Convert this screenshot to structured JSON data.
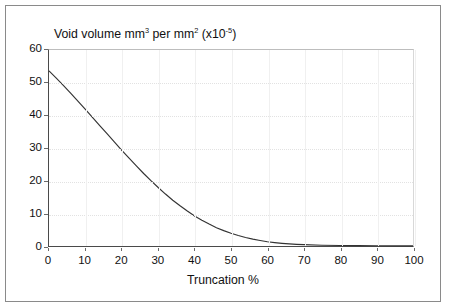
{
  "chart_data": {
    "type": "line",
    "title": "Void volume mm3 per mm2 (x10-5)",
    "title_parts": {
      "seg1": "Void volume mm",
      "sup1": "3",
      "seg2": " per mm",
      "sup2": "2",
      "seg3": " (x10",
      "sup3": "-5",
      "seg4": ")"
    },
    "xlabel": "Truncation %",
    "ylabel": "",
    "xlim": [
      0,
      100
    ],
    "ylim": [
      0,
      60
    ],
    "xticks": [
      "0",
      "10",
      "20",
      "30",
      "40",
      "50",
      "60",
      "70",
      "80",
      "90",
      "100"
    ],
    "yticks": [
      "0",
      "10",
      "20",
      "30",
      "40",
      "50",
      "60"
    ],
    "grid": "both-faint",
    "legend": "none",
    "line_color": "#333333",
    "x": [
      0,
      2,
      4,
      6,
      8,
      10,
      12,
      14,
      16,
      18,
      20,
      22,
      24,
      26,
      28,
      30,
      32,
      34,
      36,
      38,
      40,
      42,
      44,
      46,
      48,
      50,
      52,
      54,
      56,
      58,
      60,
      62,
      64,
      66,
      68,
      70,
      75,
      80,
      85,
      90,
      95,
      100
    ],
    "values": [
      53.6,
      51.4,
      49.1,
      46.7,
      44.3,
      41.8,
      39.3,
      36.8,
      34.3,
      31.8,
      29.3,
      26.9,
      24.5,
      22.2,
      20.0,
      17.9,
      15.9,
      14.0,
      12.3,
      10.7,
      9.2,
      7.9,
      6.7,
      5.6,
      4.7,
      3.9,
      3.2,
      2.6,
      2.1,
      1.7,
      1.3,
      1.05,
      0.82,
      0.64,
      0.5,
      0.4,
      0.22,
      0.14,
      0.1,
      0.07,
      0.05,
      0.04
    ]
  }
}
